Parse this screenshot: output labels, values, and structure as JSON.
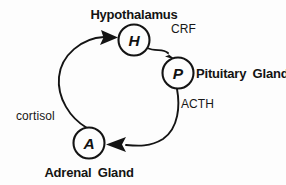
{
  "diagram": {
    "type": "cycle-diagram",
    "background_color": "#fdfdfd",
    "ink_color": "#141414",
    "nodes": [
      {
        "id": "hypothalamus",
        "letter": "H",
        "label": "Hypothalamus",
        "label_position": "above",
        "cx": 134,
        "cy": 40,
        "r": 15.5
      },
      {
        "id": "pituitary",
        "letter": "P",
        "label": "Pituitary Gland",
        "label_position": "right",
        "cx": 178,
        "cy": 73,
        "r": 15.5
      },
      {
        "id": "adrenal",
        "letter": "A",
        "label": "Adrenal Gland",
        "label_position": "below",
        "cx": 89,
        "cy": 143,
        "r": 15.5
      }
    ],
    "edges": [
      {
        "id": "crf",
        "label": "CRF",
        "from": "hypothalamus",
        "to": "pituitary",
        "label_x": 171,
        "label_y": 33
      },
      {
        "id": "acth",
        "label": "ACTH",
        "from": "pituitary",
        "to": "adrenal",
        "label_x": 181,
        "label_y": 108
      },
      {
        "id": "cortisol",
        "label": "cortisol",
        "from": "adrenal",
        "to": "hypothalamus",
        "label_x": 16,
        "label_y": 120
      }
    ]
  }
}
